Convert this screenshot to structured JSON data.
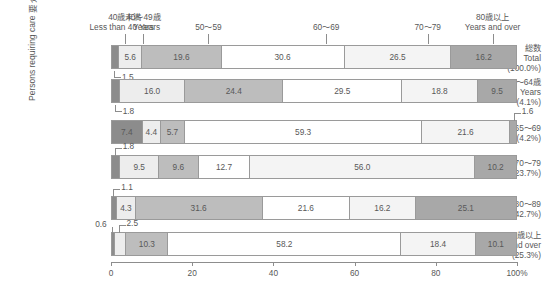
{
  "axis_title": {
    "jp": "要介護者等",
    "en": "Persons requiring care"
  },
  "x_axis": {
    "ticks": [
      "0",
      "20",
      "40",
      "60",
      "80",
      "100%"
    ],
    "values": [
      0,
      20,
      40,
      60,
      80,
      100
    ],
    "unit": "%"
  },
  "legend_headers": [
    {
      "jp": "40歳未満",
      "en": "Less than 40 Years",
      "at": 3.4
    },
    {
      "jp": "40〜49歳",
      "en": "Years",
      "at": 8.0
    },
    {
      "jp": "50〜59",
      "en": "",
      "at": 24.0
    },
    {
      "jp": "60〜69",
      "en": "",
      "at": 53.0
    },
    {
      "jp": "70〜79",
      "en": "",
      "at": 78.0
    },
    {
      "jp": "80歳以上",
      "en": "Years and over",
      "at": 94.0
    }
  ],
  "chart_data": {
    "type": "bar",
    "orientation": "horizontal",
    "stacked": true,
    "percent": true,
    "title": "",
    "xlabel": "",
    "ylabel": "要介護者等 / Persons requiring care",
    "xlim": [
      0,
      100
    ],
    "grid": false,
    "legend_position": "top",
    "categories": [
      "40歳未満 / Less than 40 Years",
      "40〜49歳 / Years",
      "50〜59",
      "60〜69",
      "70〜79",
      "80歳以上 / Years and over"
    ],
    "rows": [
      {
        "jp": "総数",
        "en": "Total",
        "share": "(100.0%)",
        "values": [
          1.5,
          5.6,
          19.6,
          30.6,
          26.5,
          16.2
        ],
        "labels": [
          "1.5",
          "5.6",
          "19.6",
          "30.6",
          "26.5",
          "16.2"
        ],
        "callouts": [
          {
            "text": "1.5",
            "index": 0,
            "side": "below-left"
          }
        ]
      },
      {
        "jp": "40〜64歳",
        "en": "Years",
        "share": "(4.1%)",
        "values": [
          1.8,
          16.0,
          24.4,
          29.5,
          18.8,
          9.5
        ],
        "labels": [
          "1.8",
          "16.0",
          "24.4",
          "29.5",
          "18.8",
          "9.5"
        ],
        "callouts": [
          {
            "text": "1.8",
            "index": 0,
            "side": "below-left"
          }
        ]
      },
      {
        "jp": "65〜69",
        "en": "",
        "share": "(4.2%)",
        "values": [
          7.4,
          4.4,
          5.7,
          59.3,
          21.6,
          1.6
        ],
        "labels": [
          "7.4",
          "4.4",
          "5.7",
          "59.3",
          "21.6",
          "1.6"
        ],
        "callouts": [
          {
            "text": "1.6",
            "index": 5,
            "side": "above-right"
          }
        ]
      },
      {
        "jp": "70〜79",
        "en": "",
        "share": "(23.7%)",
        "values": [
          1.8,
          9.5,
          9.6,
          12.7,
          56.0,
          10.2
        ],
        "labels": [
          "1.8",
          "9.5",
          "9.6",
          "12.7",
          "56.0",
          "10.2"
        ],
        "callouts": [
          {
            "text": "1.8",
            "index": 0,
            "side": "above-left"
          }
        ]
      },
      {
        "jp": "80〜89",
        "en": "",
        "share": "(42.7%)",
        "values": [
          1.1,
          4.3,
          31.6,
          21.6,
          16.2,
          25.1
        ],
        "labels": [
          "1.1",
          "4.3",
          "31.6",
          "21.6",
          "16.2",
          "25.1"
        ],
        "callouts": [
          {
            "text": "1.1",
            "index": 0,
            "side": "above-left"
          }
        ]
      },
      {
        "jp": "90歳以上",
        "en": "Years and over",
        "share": "(25.3%)",
        "values": [
          0.6,
          2.5,
          10.3,
          58.2,
          18.4,
          10.1
        ],
        "labels": [
          "0.6",
          "2.5",
          "10.3",
          "58.2",
          "18.4",
          "10.1"
        ],
        "callouts": [
          {
            "text": "0.6",
            "index": 0,
            "side": "above-far-left"
          },
          {
            "text": "2.5",
            "index": 1,
            "side": "above-left"
          }
        ]
      }
    ],
    "series_colors": [
      "#8c8c8c",
      "#ededed",
      "#bdbdbd",
      "#ffffff",
      "#f4f4f4",
      "#a8a8a8"
    ]
  }
}
